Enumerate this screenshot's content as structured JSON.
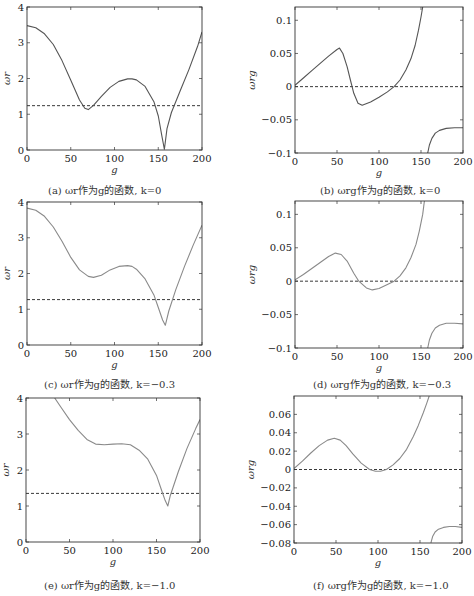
{
  "chart_data": [
    {
      "id": "a",
      "type": "line",
      "caption": "(a) ωr作为g的函数, k=0",
      "xlabel": "g",
      "ylabel": "ωr",
      "xlim": [
        0,
        200
      ],
      "ylim": [
        0,
        4
      ],
      "xticks": [
        0,
        50,
        100,
        150,
        200
      ],
      "yticks": [
        0,
        1,
        2,
        3,
        4
      ],
      "ytick_labels": [
        "0",
        "1",
        "2",
        "3",
        "4"
      ],
      "box": {
        "left": 27,
        "top": 7,
        "right": 202,
        "bottom": 150
      },
      "reference_line": 1.24,
      "series": [
        {
          "name": "ωr",
          "x": [
            0,
            10,
            20,
            30,
            40,
            50,
            60,
            66,
            70,
            76,
            85,
            95,
            105,
            115,
            120,
            125,
            135,
            145,
            150,
            154,
            157,
            160,
            165,
            175,
            185,
            195,
            200
          ],
          "y": [
            3.48,
            3.42,
            3.25,
            2.95,
            2.5,
            1.95,
            1.4,
            1.17,
            1.13,
            1.25,
            1.5,
            1.75,
            1.92,
            1.99,
            1.99,
            1.96,
            1.78,
            1.35,
            0.95,
            0.4,
            0.02,
            0.6,
            1.05,
            1.65,
            2.25,
            2.9,
            3.3
          ]
        }
      ]
    },
    {
      "id": "b",
      "type": "line",
      "caption": "(b) ωrg作为g的函数, k=0",
      "xlabel": "g",
      "ylabel": "ωrg",
      "xlim": [
        0,
        200
      ],
      "ylim": [
        -0.1,
        0.12
      ],
      "xticks": [
        0,
        50,
        100,
        150,
        200
      ],
      "yticks": [
        -0.1,
        -0.05,
        0,
        0.05,
        0.1
      ],
      "ytick_labels": [
        "−0.1",
        "−0.05",
        "0",
        "0.05",
        "0.1"
      ],
      "box": {
        "left": 295,
        "top": 7,
        "right": 463,
        "bottom": 153
      },
      "reference_line": 0,
      "series": [
        {
          "name": "branch1",
          "x": [
            0,
            10,
            20,
            30,
            40,
            50,
            53,
            57,
            62,
            66,
            70,
            75,
            80,
            90,
            100,
            110,
            118,
            125,
            132,
            138,
            143,
            147,
            150,
            152
          ],
          "y": [
            0.002,
            0.013,
            0.024,
            0.035,
            0.046,
            0.056,
            0.058,
            0.05,
            0.03,
            0.01,
            -0.01,
            -0.025,
            -0.028,
            -0.023,
            -0.016,
            -0.008,
            0.0,
            0.01,
            0.025,
            0.042,
            0.062,
            0.085,
            0.105,
            0.12
          ]
        },
        {
          "name": "branch2",
          "x": [
            158,
            160,
            163,
            167,
            172,
            180,
            190,
            200
          ],
          "y": [
            -0.1,
            -0.088,
            -0.078,
            -0.07,
            -0.066,
            -0.063,
            -0.062,
            -0.062
          ]
        }
      ]
    },
    {
      "id": "c",
      "type": "line",
      "caption": "(c) ωr作为g的函数, k=−0.3",
      "xlabel": "g",
      "ylabel": "ωr",
      "xlim": [
        0,
        200
      ],
      "ylim": [
        0,
        4
      ],
      "xticks": [
        0,
        50,
        100,
        150,
        200
      ],
      "yticks": [
        0,
        1,
        2,
        3,
        4
      ],
      "ytick_labels": [
        "0",
        "1",
        "2",
        "3",
        "4"
      ],
      "box": {
        "left": 27,
        "top": 202,
        "right": 202,
        "bottom": 345
      },
      "reference_line": 1.27,
      "series": [
        {
          "name": "ωr",
          "x": [
            0,
            10,
            20,
            30,
            40,
            50,
            60,
            70,
            76,
            85,
            95,
            105,
            115,
            120,
            125,
            135,
            145,
            150,
            155,
            158,
            162,
            170,
            180,
            190,
            200
          ],
          "y": [
            3.83,
            3.77,
            3.6,
            3.3,
            2.9,
            2.45,
            2.1,
            1.92,
            1.89,
            1.95,
            2.1,
            2.2,
            2.22,
            2.2,
            2.12,
            1.85,
            1.4,
            1.05,
            0.7,
            0.55,
            0.95,
            1.55,
            2.2,
            2.8,
            3.35
          ]
        }
      ]
    },
    {
      "id": "d",
      "type": "line",
      "caption": "(d) ωrg作为g的函数, k=−0.3",
      "xlabel": "g",
      "ylabel": "ωrg",
      "xlim": [
        0,
        200
      ],
      "ylim": [
        -0.1,
        0.12
      ],
      "xticks": [
        0,
        50,
        100,
        150,
        200
      ],
      "yticks": [
        -0.1,
        -0.05,
        0,
        0.05,
        0.1
      ],
      "ytick_labels": [
        "−0.1",
        "−0.05",
        "0",
        "0.05",
        "0.1"
      ],
      "box": {
        "left": 295,
        "top": 201,
        "right": 463,
        "bottom": 348
      },
      "reference_line": 0,
      "series": [
        {
          "name": "branch1",
          "x": [
            0,
            10,
            20,
            30,
            40,
            48,
            55,
            62,
            70,
            76,
            85,
            92,
            100,
            110,
            118,
            125,
            132,
            138,
            144,
            148,
            152,
            154
          ],
          "y": [
            0.002,
            0.01,
            0.019,
            0.028,
            0.037,
            0.042,
            0.04,
            0.03,
            0.012,
            0.0,
            -0.01,
            -0.013,
            -0.011,
            -0.005,
            0.0,
            0.008,
            0.02,
            0.035,
            0.055,
            0.075,
            0.1,
            0.12
          ]
        },
        {
          "name": "branch2",
          "x": [
            158,
            160,
            163,
            167,
            172,
            180,
            190,
            200
          ],
          "y": [
            -0.1,
            -0.088,
            -0.078,
            -0.07,
            -0.066,
            -0.063,
            -0.063,
            -0.064
          ]
        }
      ]
    },
    {
      "id": "e",
      "type": "line",
      "caption": "(e) ωr作为g的函数, k=−1.0",
      "xlabel": "g",
      "ylabel": "ωr",
      "xlim": [
        0,
        200
      ],
      "ylim": [
        0,
        4
      ],
      "xticks": [
        0,
        50,
        100,
        150,
        200
      ],
      "yticks": [
        0,
        1,
        2,
        3,
        4
      ],
      "ytick_labels": [
        "0",
        "1",
        "2",
        "3",
        "4"
      ],
      "box": {
        "left": 26,
        "top": 398,
        "right": 200,
        "bottom": 542
      },
      "reference_line": 1.35,
      "series": [
        {
          "name": "ωr",
          "x": [
            33,
            40,
            50,
            60,
            70,
            80,
            90,
            100,
            110,
            120,
            130,
            140,
            150,
            155,
            160,
            163,
            166,
            175,
            185,
            195,
            200
          ],
          "y": [
            4.0,
            3.75,
            3.4,
            3.1,
            2.85,
            2.72,
            2.7,
            2.72,
            2.73,
            2.7,
            2.55,
            2.3,
            1.85,
            1.5,
            1.15,
            1.0,
            1.3,
            1.95,
            2.6,
            3.15,
            3.4
          ]
        }
      ]
    },
    {
      "id": "f",
      "type": "line",
      "caption": "(f) ωrg作为g的函数, k=−1.0",
      "xlabel": "g",
      "ylabel": "ωrg",
      "xlim": [
        0,
        200
      ],
      "ylim": [
        -0.08,
        0.08
      ],
      "xticks": [
        0,
        50,
        100,
        150,
        200
      ],
      "yticks": [
        -0.08,
        -0.06,
        -0.04,
        -0.02,
        0,
        0.02,
        0.04,
        0.06
      ],
      "ytick_labels": [
        "−0.08",
        "−0.06",
        "−0.04",
        "−0.02",
        "0",
        "0.02",
        "0.04",
        "0.06"
      ],
      "box": {
        "left": 294,
        "top": 396,
        "right": 462,
        "bottom": 543
      },
      "reference_line": 0,
      "series": [
        {
          "name": "branch1",
          "x": [
            0,
            10,
            20,
            30,
            40,
            48,
            55,
            62,
            70,
            80,
            90,
            97,
            103,
            110,
            118,
            126,
            134,
            142,
            148,
            154,
            158,
            161
          ],
          "y": [
            0.001,
            0.009,
            0.018,
            0.026,
            0.032,
            0.034,
            0.032,
            0.026,
            0.017,
            0.007,
            0.0,
            -0.002,
            -0.002,
            0.0,
            0.005,
            0.012,
            0.022,
            0.036,
            0.048,
            0.062,
            0.072,
            0.08
          ]
        },
        {
          "name": "branch2",
          "x": [
            163,
            165,
            168,
            172,
            178,
            185,
            192,
            200
          ],
          "y": [
            -0.08,
            -0.073,
            -0.068,
            -0.065,
            -0.063,
            -0.062,
            -0.062,
            -0.063
          ]
        }
      ]
    }
  ],
  "captions": {
    "a": "(a) ωr作为g的函数, k=0",
    "b": "(b) ωrg作为g的函数, k=0",
    "c": "(c) ωr作为g的函数, k=−0.3",
    "d": "(d) ωrg作为g的函数, k=−0.3",
    "e": "(e) ωr作为g的函数, k=−1.0",
    "f": "(f) ωrg作为g的函数, k=−1.0"
  },
  "colors": {
    "curve_dark": "#555555",
    "curve_light": "#8a8a8a",
    "axis": "#333333",
    "reference": "#222222"
  }
}
